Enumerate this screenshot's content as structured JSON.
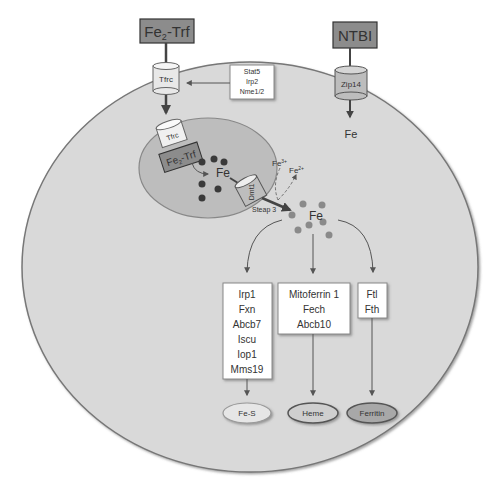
{
  "extracellular": {
    "fe2_trf": {
      "label_main": "Fe",
      "label_sub": "2",
      "label_tail": "-Trf"
    },
    "ntbi": {
      "label": "NTBI"
    }
  },
  "membrane": {
    "tfrc": {
      "label": "Tfrc"
    },
    "zip14": {
      "label": "Zip14"
    }
  },
  "regulators": {
    "items": [
      "Stat5",
      "Irp2",
      "Nme1/2"
    ]
  },
  "cytosol": {
    "zip14_fe": "Fe",
    "labile_fe": "Fe",
    "fe3": {
      "main": "Fe",
      "sup": "3+"
    },
    "fe2": {
      "main": "Fe",
      "sup": "2+"
    },
    "steap3": "Steap 3"
  },
  "endosome": {
    "tfrc": "Tfrc",
    "fe2_trf": {
      "label_main": "Fe",
      "label_sub": "2",
      "label_tail": "-Trf"
    },
    "fe": "Fe",
    "dmt1": "Dmt1"
  },
  "pathways": {
    "fes": {
      "genes": [
        "Irp1",
        "Fxn",
        "Abcb7",
        "Iscu",
        "Iop1",
        "Mms19"
      ],
      "product": "Fe-S"
    },
    "heme": {
      "genes": [
        "Mitoferrin 1",
        "Fech",
        "Abcb10"
      ],
      "product": "Heme"
    },
    "ferritin": {
      "genes": [
        "Ftl",
        "Fth"
      ],
      "product": "Ferritin"
    }
  },
  "colors": {
    "cell_fill": "#d9d9d9",
    "cell_stroke": "#777777",
    "endosome_fill": "#bdbdbd",
    "box_dark": "#8c8c8c",
    "iron_dark": "#3a3a3a",
    "iron_light": "#8a8a8a",
    "fes_fill": "#e6e6e6",
    "heme_fill": "#cfcfcf",
    "ferritin_fill": "#a8a8a8"
  }
}
